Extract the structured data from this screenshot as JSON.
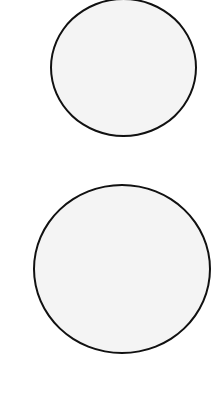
{
  "canvas": {
    "background": "#ffffff"
  },
  "shapes": [
    {
      "name": "top-circle",
      "type": "ellipse",
      "left": 50,
      "top": -2,
      "width": 147,
      "height": 139,
      "fill": "#f4f4f4",
      "stroke": "#111111"
    },
    {
      "name": "bottom-circle",
      "type": "ellipse",
      "left": 33,
      "top": 184,
      "width": 178,
      "height": 170,
      "fill": "#f4f4f4",
      "stroke": "#111111"
    }
  ]
}
